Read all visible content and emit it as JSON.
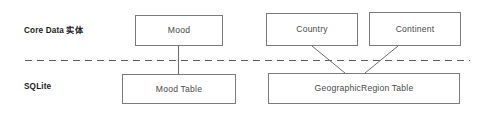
{
  "diagram": {
    "layers": [
      {
        "id": "core-data",
        "label": "Core Data 实体"
      },
      {
        "id": "sqlite",
        "label": "SQLite"
      }
    ],
    "entities": [
      {
        "id": "mood",
        "label": "Mood"
      },
      {
        "id": "country",
        "label": "Country"
      },
      {
        "id": "continent",
        "label": "Continent"
      }
    ],
    "tables": [
      {
        "id": "mood-table",
        "label": "Mood Table"
      },
      {
        "id": "georegion-table",
        "label": "GeographicRegion Table"
      }
    ],
    "divider": {
      "style": "dashed"
    },
    "colors": {
      "background": "#ffffff",
      "box_border": "#7b7b7b",
      "box_text": "#4a4a4a",
      "label_text": "#1c1c1c",
      "connector": "#6e6e6e",
      "divider": "#5c5c5c"
    }
  }
}
